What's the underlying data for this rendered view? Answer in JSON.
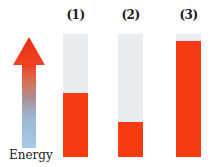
{
  "figure": {
    "type": "energy-level-comparison",
    "energy_axis": {
      "label": "Energy",
      "direction": "up",
      "gradient_top_to_bottom": [
        "#ee2d10",
        "#ee4322",
        "#d3755a",
        "#a9909a",
        "#9db6d4",
        "#a6cae9"
      ]
    },
    "bars": [
      {
        "label": "(1)",
        "fill_percent": 52
      },
      {
        "label": "(2)",
        "fill_percent": 28.5
      },
      {
        "label": "(3)",
        "fill_percent": 94
      }
    ],
    "colors": {
      "filled": "#f83c12",
      "empty": "#e9edf2",
      "background": "#ffffff",
      "text": "#1c1c1c"
    }
  }
}
